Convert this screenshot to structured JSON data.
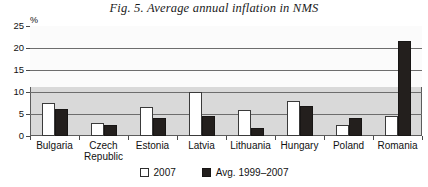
{
  "figure": {
    "title": "Fig. 5. Average annual inflation in NMS",
    "unit_label": "%"
  },
  "legend": {
    "items": [
      {
        "label": "2007",
        "swatch": "white-square-icon",
        "color": "#ffffff"
      },
      {
        "label": "Avg. 1999–2007",
        "swatch": "black-square-icon",
        "color": "#231f1d"
      }
    ]
  },
  "chart_data": {
    "type": "bar",
    "title": "Fig. 5. Average annual inflation in NMS",
    "xlabel": "",
    "ylabel": "%",
    "ylim": [
      0,
      25
    ],
    "yticks": [
      0,
      5,
      10,
      15,
      20,
      25
    ],
    "grid": true,
    "legend_position": "bottom",
    "categories": [
      "Bulgaria",
      "Czech Republic",
      "Estonia",
      "Latvia",
      "Lithuania",
      "Hungary",
      "Poland",
      "Romania"
    ],
    "series": [
      {
        "name": "2007",
        "color": "#ffffff",
        "values": [
          7.5,
          3.0,
          6.6,
          10.1,
          5.8,
          7.9,
          2.5,
          4.6
        ]
      },
      {
        "name": "Avg. 1999–2007",
        "color": "#231f1d",
        "values": [
          6.2,
          2.5,
          4.2,
          4.6,
          1.9,
          6.8,
          4.2,
          21.5
        ]
      }
    ]
  }
}
